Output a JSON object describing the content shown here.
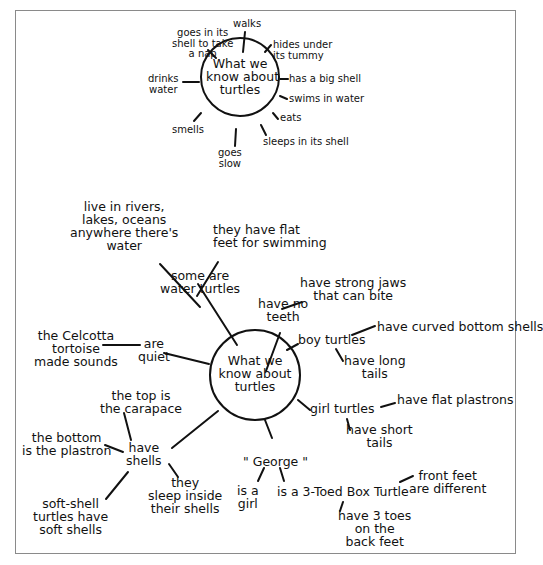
{
  "diagram_1": {
    "center": "What we\nknow about\nturtles",
    "branches": {
      "walks": "walks",
      "nap": "goes in its\nshell to take\na nap",
      "hides": "hides under\nits tummy",
      "drinks": "drinks\nwater",
      "big_shell": "has a big shell",
      "swims": "swims in water",
      "eats": "eats",
      "smells": "smells",
      "sleeps": "sleeps in its shell",
      "slow": "goes\nslow"
    }
  },
  "diagram_2": {
    "center": "What we\nknow about\nturtles",
    "water_turtles": {
      "label": "some are\nwater turtles",
      "habitat": "live in rivers,\nlakes, oceans\nanywhere there's\nwater",
      "flat_feet": "they have flat\nfeet for swimming"
    },
    "no_teeth": {
      "label": "have no\nteeth",
      "jaws": "have strong jaws\nthat can bite"
    },
    "boy_turtles": {
      "label": "boy turtles",
      "curved": "have curved bottom shells",
      "long_tails": "have long\ntails"
    },
    "quiet": {
      "label": "are\nquiet",
      "celcotta": "the Celcotta\ntortoise\nmade sounds"
    },
    "girl_turtles": {
      "label": "girl turtles",
      "flat_plastrons": "have flat plastrons",
      "short_tails": "have short\ntails"
    },
    "shells": {
      "label": "have\nshells",
      "top": "the top is\nthe carapace",
      "bottom": "the bottom\nis the plastron",
      "soft": "soft-shell\nturtles have\nsoft shells",
      "sleep": "they\nsleep inside\ntheir shells"
    },
    "george": {
      "label": "\" George \"",
      "girl": "is a\ngirl",
      "box_turtle": "is a 3-Toed Box Turtle",
      "front_feet": "front feet\nare different",
      "toes": "have 3 toes\non the\nback feet"
    }
  }
}
